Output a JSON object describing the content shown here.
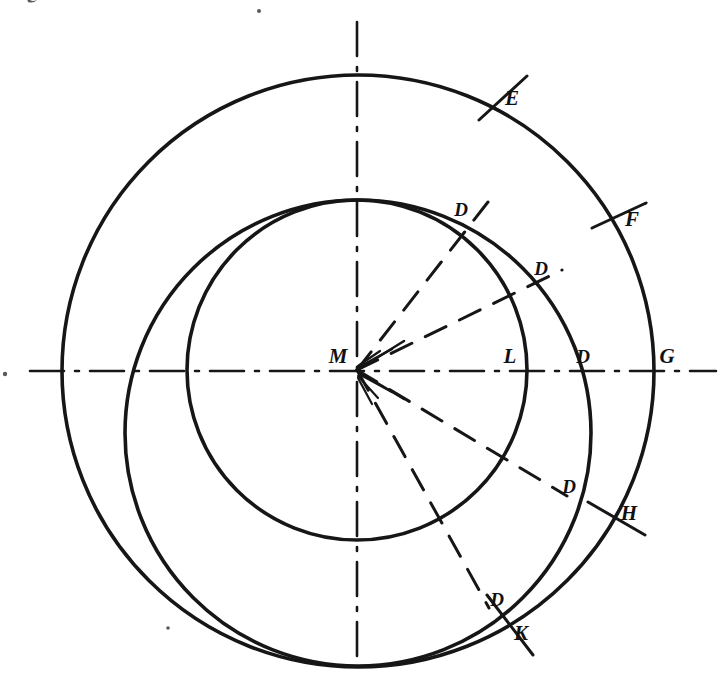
{
  "figure": {
    "background_color": "#ffffff",
    "ink_color": "#161616",
    "center_label": "M",
    "labels": [
      {
        "id": "label-M",
        "text": "M",
        "x": 338,
        "y": 363,
        "role": "center-point"
      },
      {
        "id": "label-E",
        "text": "E",
        "x": 512,
        "y": 105,
        "role": "outer-intersection"
      },
      {
        "id": "label-F",
        "text": "F",
        "x": 628,
        "y": 226,
        "role": "outer-intersection"
      },
      {
        "id": "label-G",
        "text": "G",
        "x": 663,
        "y": 363,
        "role": "outer-intersection"
      },
      {
        "id": "label-H",
        "text": "H",
        "x": 622,
        "y": 520,
        "role": "outer-intersection"
      },
      {
        "id": "label-K",
        "text": "K",
        "x": 516,
        "y": 640,
        "role": "outer-intersection"
      },
      {
        "id": "label-L",
        "text": "L",
        "x": 506,
        "y": 363,
        "role": "inner-intersection"
      },
      {
        "id": "label-D1",
        "text": "D",
        "x": 456,
        "y": 216,
        "role": "middle-intersection"
      },
      {
        "id": "label-D2",
        "text": "D",
        "x": 536,
        "y": 275,
        "role": "middle-intersection"
      },
      {
        "id": "label-D3",
        "text": "D",
        "x": 578,
        "y": 363,
        "role": "middle-intersection"
      },
      {
        "id": "label-D4",
        "text": "D",
        "x": 564,
        "y": 493,
        "role": "middle-intersection"
      },
      {
        "id": "label-D5",
        "text": "D",
        "x": 492,
        "y": 606,
        "role": "middle-intersection"
      }
    ],
    "circles": [
      {
        "id": "outer-circle",
        "cx": 358,
        "cy": 371,
        "r": 296,
        "stroke_width": 3.4
      },
      {
        "id": "middle-circle",
        "cx": 358,
        "cy": 433,
        "r": 233,
        "stroke_width": 3.4
      },
      {
        "id": "inner-circle",
        "cx": 357,
        "cy": 370,
        "r": 170,
        "stroke_width": 3.4
      }
    ],
    "axes": [
      {
        "id": "horizontal-axis",
        "x1": 30,
        "y1": 371,
        "x2": 716,
        "y2": 371,
        "style": "dash-dot"
      },
      {
        "id": "vertical-axis",
        "x1": 357,
        "y1": 22,
        "x2": 357,
        "y2": 657,
        "style": "dash-dot"
      }
    ],
    "radial_rays": [
      {
        "id": "ray-to-D1",
        "angle_deg": 52,
        "length": 213,
        "style": "dashed"
      },
      {
        "id": "ray-to-D2",
        "angle_deg": 26,
        "length": 228,
        "style": "dashed"
      },
      {
        "id": "ray-to-D3",
        "angle_deg": 0,
        "length": 226,
        "style": "axis"
      },
      {
        "id": "ray-to-D4",
        "angle_deg": -31,
        "length": 245,
        "style": "dashed"
      },
      {
        "id": "ray-to-D5",
        "angle_deg": -61,
        "length": 272,
        "style": "dashed"
      }
    ],
    "tick_marks": [
      {
        "id": "tick-E",
        "cx": 500,
        "cy": 96,
        "angle_deg": 56,
        "length": 56
      },
      {
        "id": "tick-F",
        "cx": 616,
        "cy": 215,
        "angle_deg": 26,
        "length": 56
      },
      {
        "id": "tick-H",
        "cx": 612,
        "cy": 516,
        "angle_deg": -30,
        "length": 58
      },
      {
        "id": "tick-K",
        "cx": 508,
        "cy": 624,
        "angle_deg": -62,
        "length": 60
      }
    ],
    "specks": [
      {
        "id": "speck-top-left",
        "x": 31,
        "y": 3,
        "r": 4
      },
      {
        "id": "speck-top-center",
        "x": 259,
        "y": 11,
        "r": 2
      },
      {
        "id": "speck-left-axis",
        "x": 5,
        "y": 374,
        "r": 2
      },
      {
        "id": "speck-low-left",
        "x": 168,
        "y": 628,
        "r": 2
      }
    ]
  }
}
